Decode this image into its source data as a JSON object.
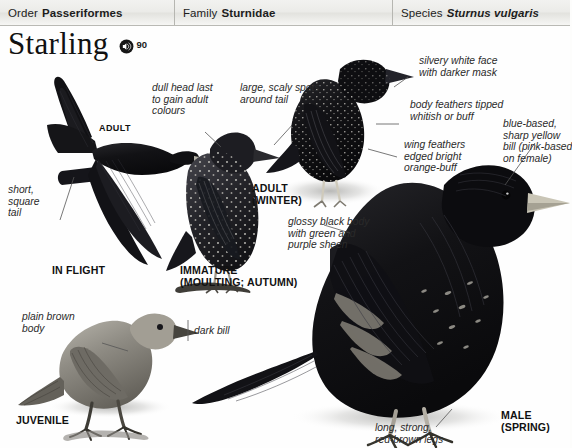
{
  "header": {
    "order": {
      "label": "Order",
      "value": "Passeriformes"
    },
    "family": {
      "label": "Family",
      "value": "Sturnidae"
    },
    "species": {
      "label": "Species",
      "value": "Sturnus vulgaris"
    }
  },
  "title": {
    "name": "Starling",
    "sound_icon": "speaker-icon",
    "sound_number": "90"
  },
  "annotations": {
    "short_square_tail": "short,\nsquare\ntail",
    "dull_head": "dull head last\nto gain adult\ncolours",
    "scaly_spots": "large, scaly spots\naround tail",
    "silvery_face": "silvery white face\nwith darker mask",
    "body_feathers": "body feathers tipped\nwhitish or buff",
    "wing_feathers": "wing feathers\nedged bright\norange-buff",
    "bill": "blue-based,\nsharp yellow\nbill (pink-based\non female)",
    "glossy_body": "glossy black body\nwith green and\npurple sheen",
    "plain_brown": "plain brown\nbody",
    "dark_bill": "dark bill",
    "legs": "long, strong,\nred-brown legs"
  },
  "captions": {
    "adult": "ADULT",
    "in_flight": "IN FLIGHT",
    "immature": "IMMATURE\n(MOULTING; AUTUMN)",
    "adult_winter": "ADULT\n(WINTER)",
    "juvenile": "JUVENILE",
    "male_spring": "MALE\n(SPRING)"
  },
  "colors": {
    "page_background": "#fefefe",
    "header_background": "#ebebe8",
    "header_border": "#b6b6b1",
    "text": "#1c1c1c",
    "annotation_text": "#2a2a2a",
    "plumage_dark": "#17171a",
    "plumage_mid": "#4a4a4d",
    "plumage_light": "#9b9a95",
    "bill_pale": "#d8d4c6",
    "leg_tone": "#8c8880"
  }
}
